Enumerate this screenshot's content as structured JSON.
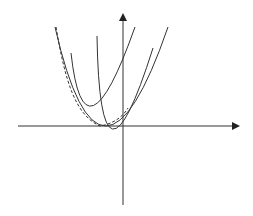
{
  "diagram": {
    "type": "family of parabolas with envelope",
    "axes": {
      "x_axis": {
        "from": [
          18,
          126
        ],
        "to": [
          238,
          126
        ],
        "arrow": true
      },
      "y_axis": {
        "from": [
          123,
          205
        ],
        "to": [
          123,
          15
        ],
        "arrow": true
      }
    },
    "curves": [
      {
        "name": "parabola-1",
        "style": "solid",
        "path": "M71,53 Q84,171 135,27"
      },
      {
        "name": "parabola-2",
        "style": "solid",
        "path": "M97,36 Q100,216 153,48"
      },
      {
        "name": "parabola-3",
        "style": "solid",
        "path": "M55,27 Q100,225 168,27"
      },
      {
        "name": "envelope",
        "style": "dashed",
        "path": "M56,27 C65,80 75,115 100,126 C112,124 122,118 128,108"
      }
    ],
    "colors": {
      "stroke": "#333333",
      "background": "#ffffff"
    }
  }
}
